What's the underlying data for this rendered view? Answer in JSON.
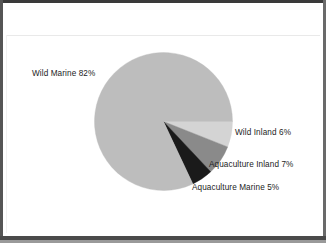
{
  "figure": {
    "background_color": "#ffffff",
    "frame_color": "#3a3a3a"
  },
  "chart_data": {
    "type": "pie",
    "title": "",
    "xlabel": "",
    "ylabel": "",
    "legend_position": "none",
    "grid": false,
    "labels_on_slices": false,
    "start_angle_deg": 0,
    "direction": "clockwise",
    "categories": [
      "Wild Inland",
      "Aquaculture Inland",
      "Aquaculture Marine",
      "Wild Marine"
    ],
    "values": [
      6,
      7,
      5,
      82
    ],
    "units": "percent",
    "colors": [
      "#d4d4d4",
      "#8a8a8a",
      "#1a1a1a",
      "#bdbdbd"
    ],
    "annotations": [
      {
        "text": "Wild Marine  82%",
        "category": "Wild Marine",
        "value": 82
      },
      {
        "text": "Wild Inland  6%",
        "category": "Wild Inland",
        "value": 6
      },
      {
        "text": "Aquaculture Inland  7%",
        "category": "Aquaculture Inland",
        "value": 7
      },
      {
        "text": "Aquaculture Marine  5%",
        "category": "Aquaculture Marine",
        "value": 5
      }
    ]
  },
  "labels": {
    "wild_marine": "Wild Marine  82%",
    "wild_inland": "Wild Inland  6%",
    "aquaculture_inland": "Aquaculture Inland  7%",
    "aquaculture_marine": "Aquaculture Marine  5%"
  }
}
